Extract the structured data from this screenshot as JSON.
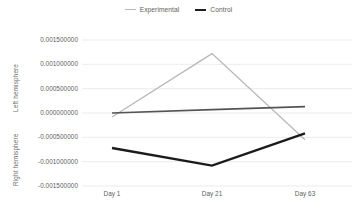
{
  "legend": {
    "position": "top-center",
    "items": [
      {
        "label": "Experimental",
        "color": "#b7b7b7",
        "swatch": "line-swatch-icon"
      },
      {
        "label": "Control",
        "color": "#1f1f1f",
        "swatch": "line-swatch-icon"
      }
    ]
  },
  "axes": {
    "y_upper_title": "Left hemisphere",
    "y_lower_title": "Right hemisphere",
    "y_ticks": [
      "0.001500000",
      "0.001000000",
      "0.000500000",
      "0.000000000",
      "-0.000500000",
      "-0.001000000",
      "-0.001500000"
    ],
    "x_ticks": [
      "Day 1",
      "Day 21",
      "Day 63"
    ]
  },
  "colors": {
    "experimental": "#b7b7b7",
    "control_dark": "#1b1b1b",
    "control_mid": "#555555",
    "grid": "#e6e6e6",
    "text": "#5e5e5e",
    "background": "#ffffff"
  },
  "chart_data": {
    "type": "line",
    "title": "",
    "subtitle": "",
    "xlabel": "",
    "ylabel": "Left hemisphere / Right hemisphere",
    "categories": [
      "Day 1",
      "Day 21",
      "Day 63"
    ],
    "ylim": [
      -0.0015,
      0.0015
    ],
    "ytick_values": [
      0.0015,
      0.001,
      0.0005,
      0.0,
      -0.0005,
      -0.001,
      -0.0015
    ],
    "grid": true,
    "legend_position": "top-center",
    "series": [
      {
        "name": "Experimental",
        "hemisphere": "left",
        "color": "#b7b7b7",
        "width": 1.2,
        "values": [
          -8e-05,
          0.00122,
          -0.00055
        ]
      },
      {
        "name": "Control",
        "hemisphere": "left",
        "color": "#555555",
        "width": 1.6,
        "values": [
          0.0,
          7e-05,
          0.00013
        ]
      },
      {
        "name": "Control",
        "hemisphere": "right",
        "color": "#1b1b1b",
        "width": 2.4,
        "values": [
          -0.00072,
          -0.00108,
          -0.00042
        ]
      }
    ]
  },
  "geometry": {
    "plot_left": 82,
    "plot_right": 352,
    "plot_top": 40,
    "plot_bottom": 186,
    "x_positions": [
      112,
      212,
      305
    ],
    "xtick_label_y": 190
  }
}
